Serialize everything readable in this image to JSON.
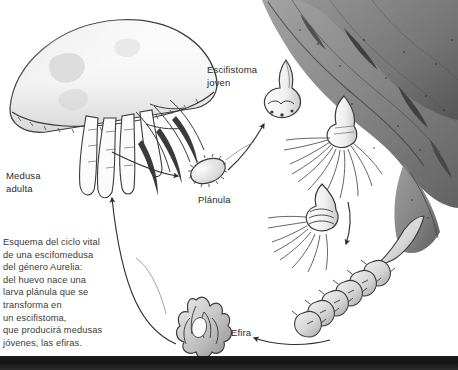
{
  "figure": {
    "title": "Ciclo vital de una escifomedusa del género Aurelia",
    "background_color": "#ffffff",
    "ink_color": "#3a3a3a"
  },
  "caption": {
    "name": "life-cycle-caption",
    "text": "Esquema del ciclo vital\nde una escifomedusa\ndel género Aurelia:\ndel huevo nace una\nlarva plánula que se\ntransforma en\nun escifistoma,\nque producirá medusas\njóvenes, las efiras."
  },
  "labels": [
    {
      "id": "medusa-adulta",
      "text": "Medusa\nadulta",
      "x": 6,
      "y": 170
    },
    {
      "id": "escifistoma-joven",
      "text": "Escifistoma\njoven",
      "x": 207,
      "y": 64
    },
    {
      "id": "planula",
      "text": "Plánula",
      "x": 198,
      "y": 194
    },
    {
      "id": "efira",
      "text": "Efira",
      "x": 231,
      "y": 327
    }
  ],
  "stages": [
    {
      "id": "medusa-adulta",
      "label": "Medusa adulta",
      "order": 1
    },
    {
      "id": "planula",
      "label": "Plánula",
      "order": 2
    },
    {
      "id": "escifistoma-joven",
      "label": "Escifistoma joven",
      "order": 3
    },
    {
      "id": "escifistoma-tentaculos",
      "label": "Escifistoma",
      "order": 4
    },
    {
      "id": "estrobila",
      "label": "Estróbila",
      "order": 5
    },
    {
      "id": "efira",
      "label": "Efira",
      "order": 6
    }
  ],
  "arrows": [
    {
      "id": "medusa-to-planula",
      "from": "medusa-adulta",
      "to": "planula"
    },
    {
      "id": "planula-to-escifistoma",
      "from": "planula",
      "to": "escifistoma-joven"
    },
    {
      "id": "escifistoma-to-estrobila",
      "from": "escifistoma-tentaculos",
      "to": "estrobila"
    },
    {
      "id": "estrobila-to-efira",
      "from": "estrobila",
      "to": "efira"
    },
    {
      "id": "efira-to-medusa",
      "from": "efira",
      "to": "medusa-adulta"
    }
  ],
  "scene": {
    "seafloor": "dark sediment band",
    "substrate": "algas pardas"
  }
}
